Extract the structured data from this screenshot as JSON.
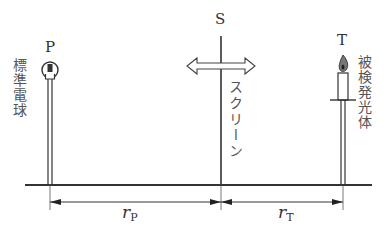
{
  "diagram": {
    "labels": {
      "standard_source_letter": "P",
      "standard_source_name": "標準電球",
      "screen_letter": "S",
      "screen_name": "スクリーン",
      "test_source_letter": "T",
      "test_source_name": "被検発光体"
    },
    "distances": {
      "standard": {
        "symbol": "r",
        "subscript": "P"
      },
      "test": {
        "symbol": "r",
        "subscript": "T"
      }
    },
    "colors": {
      "line": "#333333",
      "flame": "#555555"
    }
  }
}
